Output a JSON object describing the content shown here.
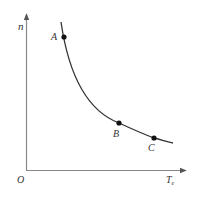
{
  "diagram": {
    "axes": {
      "y_label": "n",
      "x_label": "T",
      "x_label_subscript": "e",
      "origin_label": "O"
    },
    "curve": {
      "description": "decreasing hyperbolic-like curve (n vs Te)",
      "points": [
        {
          "label": "A",
          "x": 64,
          "y": 37
        },
        {
          "label": "B",
          "x": 119,
          "y": 123
        },
        {
          "label": "C",
          "x": 154,
          "y": 138
        }
      ]
    },
    "colors": {
      "axis": "#888888",
      "curve": "#333333",
      "point": "#111111",
      "text": "#333333"
    }
  }
}
